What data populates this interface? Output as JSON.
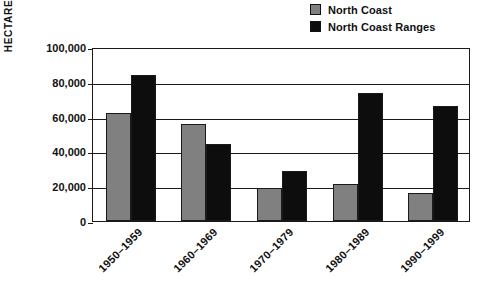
{
  "chart_data": {
    "type": "bar",
    "title": "",
    "subtitle": "",
    "xlabel": "",
    "ylabel": "HECTARES BURNED",
    "categories": [
      "1950–1959",
      "1960–1969",
      "1970–1979",
      "1980–1989",
      "1990–1999"
    ],
    "series": [
      {
        "name": "North Coast",
        "color": "#808080",
        "values": [
          62000,
          56000,
          19000,
          21000,
          16000
        ]
      },
      {
        "name": "North Coast Ranges",
        "color": "#0d0d0d",
        "values": [
          84000,
          44000,
          29000,
          73500,
          66000
        ]
      }
    ],
    "ylim": [
      0,
      100000
    ],
    "ytick_values": [
      0,
      20000,
      40000,
      60000,
      80000,
      100000
    ],
    "ytick_labels": [
      "0",
      "20,000",
      "40,000",
      "60,000",
      "80,000",
      "100,000"
    ],
    "grid": true,
    "grid_axis": "y",
    "legend_position": "top-right",
    "x_tick_label_rotation": -45
  },
  "legend": {
    "entries": [
      {
        "label": "North Coast",
        "swatch_color": "#808080"
      },
      {
        "label": "North Coast Ranges",
        "swatch_color": "#0d0d0d"
      }
    ]
  },
  "axes": {
    "y_title": "HECTARES BURNED",
    "frame_color": "#1a1a1a"
  }
}
